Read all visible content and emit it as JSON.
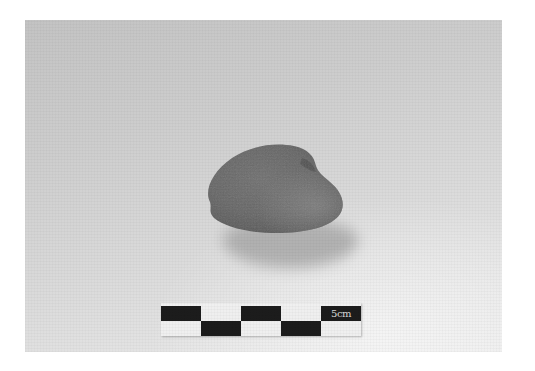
{
  "image": {
    "description": "Photograph of a rounded grey stone artifact with a black-and-white 5 cm scale bar beneath it on a light grey background",
    "colors": {
      "background_top": "#c3c3c3",
      "background_bottom": "#ebebeb",
      "stone": "#6b6b6b",
      "stone_dark": "#555555",
      "shadow": "#a9a9a9",
      "scale_black": "#1c1c1c",
      "scale_white": "#efefef"
    }
  },
  "scale_bar": {
    "label": "5cm",
    "top_row": [
      "black",
      "white",
      "black",
      "white",
      "black"
    ],
    "bottom_row": [
      "white",
      "black",
      "white",
      "black",
      "white"
    ]
  }
}
